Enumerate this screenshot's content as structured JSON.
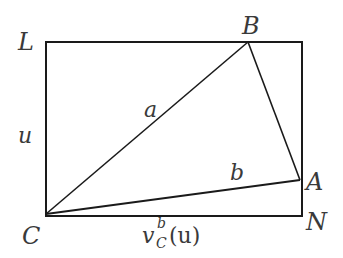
{
  "diagram": {
    "type": "geometry-figure",
    "rectangle": {
      "corners": [
        "L",
        "N",
        "C"
      ],
      "x": 46,
      "y": 42,
      "width": 256,
      "height": 174
    },
    "points": {
      "L": {
        "label": "L",
        "x": 46,
        "y": 42
      },
      "B": {
        "label": "B",
        "x": 248,
        "y": 42
      },
      "A": {
        "label": "A",
        "x": 300,
        "y": 180
      },
      "C": {
        "label": "C",
        "x": 46,
        "y": 214
      },
      "N": {
        "label": "N",
        "x": 302,
        "y": 216
      }
    },
    "segments": [
      {
        "from": "C",
        "to": "B",
        "label": "a"
      },
      {
        "from": "C",
        "to": "A",
        "label": "b"
      },
      {
        "from": "B",
        "to": "A",
        "label": ""
      }
    ],
    "side_labels": {
      "left": "u",
      "bottom_main": "v",
      "bottom_sup": "b",
      "bottom_sub": "C",
      "bottom_arg": "(u)"
    },
    "colors": {
      "stroke": "#1a1a1a",
      "text": "#3a3a3a",
      "background": "#ffffff"
    }
  }
}
